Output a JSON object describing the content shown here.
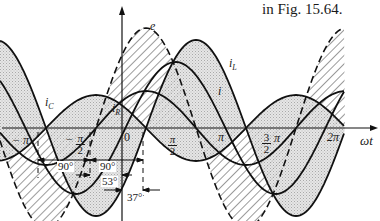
{
  "caption": "in Fig. 15.64.",
  "axes": {
    "origin_x": 122,
    "origin_y": 128,
    "x_start": 2,
    "x_end": 378,
    "y_top": 8,
    "y_bottom": 221,
    "x_axis_label": "ωt"
  },
  "x_ticks": [
    {
      "label": "− π",
      "x": 12,
      "y": 134
    },
    {
      "label_num": "π",
      "label_den": "2",
      "sign": "−",
      "x": 66,
      "y": 132
    },
    {
      "label": "0",
      "x": 124,
      "y": 131
    },
    {
      "label_num": "π",
      "label_den": "2",
      "sign": "",
      "x": 168,
      "y": 133
    },
    {
      "label": "π",
      "x": 218,
      "y": 131
    },
    {
      "label_num": "3",
      "label_den": "2",
      "suffix": "π",
      "x": 262,
      "y": 131
    },
    {
      "label": "2π",
      "x": 327,
      "y": 131
    }
  ],
  "curve_labels": {
    "e": {
      "text": "e",
      "x": 150,
      "y": 20
    },
    "i_L": {
      "text": "iL",
      "x": 229,
      "y": 57
    },
    "i": {
      "text": "i",
      "x": 218,
      "y": 85
    },
    "i_R": {
      "text": "iR",
      "x": 112,
      "y": 102
    },
    "i_C": {
      "text": "iC",
      "x": 45,
      "y": 96
    }
  },
  "angles": [
    {
      "label": "90°",
      "x": 57,
      "y": 161
    },
    {
      "label": "90°",
      "x": 99,
      "y": 161
    },
    {
      "label": "53°",
      "x": 101,
      "y": 176
    },
    {
      "label": "37°",
      "x": 126,
      "y": 192
    }
  ],
  "chart_data": {
    "type": "line",
    "xlabel": "ωt",
    "ylabel": "",
    "x_tick_labels": [
      "−π",
      "−π/2",
      "0",
      "π/2",
      "π",
      "3/2 π",
      "2π"
    ],
    "series": [
      {
        "name": "e",
        "style": "dashed, hatched",
        "amplitude_px": 100,
        "phase_deg": 0
      },
      {
        "name": "iR",
        "style": "solid",
        "amplitude_px": 37,
        "phase_deg": 0
      },
      {
        "name": "iL",
        "style": "solid, stippled",
        "amplitude_px": 88,
        "phase_deg": -90
      },
      {
        "name": "iC",
        "style": "solid, stippled",
        "amplitude_px": 33,
        "phase_deg": 90
      },
      {
        "name": "i",
        "style": "solid",
        "amplitude_px": 66,
        "phase_deg": -53
      }
    ],
    "annotations": [
      "90°",
      "90°",
      "53°",
      "37°"
    ]
  }
}
